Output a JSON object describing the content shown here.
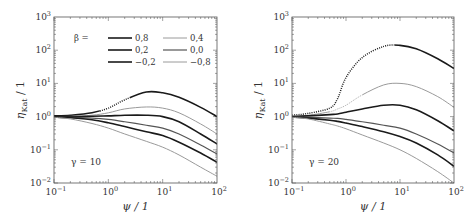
{
  "chart_data": [
    {
      "type": "line",
      "title": "",
      "annotation": "γ = 10",
      "xlabel": "ψ / 1",
      "ylabel": "η_Kat / 1",
      "xscale": "log",
      "yscale": "log",
      "xlim": [
        0.1,
        100
      ],
      "ylim": [
        0.01,
        1000
      ],
      "xticks": [
        "10^-1",
        "10^0",
        "10^1",
        "10^2"
      ],
      "yticks": [
        "10^-2",
        "10^-1",
        "10^0",
        "10^1",
        "10^2",
        "10^3"
      ],
      "grid": false,
      "legend": {
        "title": "β =",
        "position": "upper center"
      },
      "x": [
        0.1,
        0.2,
        0.5,
        1,
        2,
        5,
        10,
        20,
        50,
        100
      ],
      "series": [
        {
          "name": "0,8",
          "values": [
            1.05,
            1.1,
            1.3,
            1.8,
            3.2,
            5.5,
            5.2,
            3.8,
            1.9,
            1.0
          ],
          "style": "dark-thick",
          "dotted_range": [
            0.7,
            2.5
          ]
        },
        {
          "name": "0,4",
          "values": [
            1.0,
            1.02,
            1.1,
            1.3,
            1.7,
            1.95,
            1.8,
            1.3,
            0.6,
            0.3
          ],
          "style": "light-thin"
        },
        {
          "name": "0,2",
          "values": [
            1.0,
            1.0,
            1.02,
            1.05,
            1.1,
            1.1,
            1.0,
            0.7,
            0.3,
            0.15
          ],
          "style": "dark-thick"
        },
        {
          "name": "0,0",
          "values": [
            0.98,
            0.95,
            0.9,
            0.82,
            0.7,
            0.55,
            0.45,
            0.3,
            0.14,
            0.075
          ],
          "style": "medium"
        },
        {
          "name": "-0,2",
          "values": [
            0.97,
            0.92,
            0.8,
            0.65,
            0.5,
            0.35,
            0.27,
            0.17,
            0.08,
            0.042
          ],
          "style": "dark-thick"
        },
        {
          "name": "-0,8",
          "values": [
            0.95,
            0.85,
            0.62,
            0.45,
            0.3,
            0.18,
            0.12,
            0.07,
            0.03,
            0.016
          ],
          "style": "light-thin"
        }
      ]
    },
    {
      "type": "line",
      "title": "",
      "annotation": "γ = 20",
      "xlabel": "ψ / 1",
      "ylabel": "η_Kat / 1",
      "xscale": "log",
      "yscale": "log",
      "xlim": [
        0.1,
        100
      ],
      "ylim": [
        0.01,
        1000
      ],
      "xticks": [
        "10^-1",
        "10^0",
        "10^1",
        "10^2"
      ],
      "yticks": [
        "10^-2",
        "10^-1",
        "10^0",
        "10^1",
        "10^2",
        "10^3"
      ],
      "grid": false,
      "x": [
        0.1,
        0.2,
        0.5,
        0.7,
        1,
        2,
        5,
        10,
        20,
        50,
        100
      ],
      "series": [
        {
          "name": "0,8",
          "values": [
            1.1,
            1.25,
            1.8,
            3.5,
            15,
            60,
            130,
            140,
            110,
            55,
            28
          ],
          "style": "dark-thick",
          "dotted_range": [
            0.1,
            8
          ]
        },
        {
          "name": "0,4",
          "values": [
            1.05,
            1.1,
            1.4,
            1.7,
            2.2,
            4.5,
            9,
            10,
            8,
            4,
            1.9
          ],
          "style": "light-thin",
          "dotted_range": [
            0.5,
            2
          ]
        },
        {
          "name": "0,2",
          "values": [
            1.0,
            1.05,
            1.15,
            1.2,
            1.35,
            1.7,
            2.2,
            2.2,
            1.6,
            0.75,
            0.37
          ],
          "style": "dark-thick"
        },
        {
          "name": "0,0",
          "values": [
            0.98,
            0.95,
            0.9,
            0.88,
            0.82,
            0.7,
            0.55,
            0.45,
            0.3,
            0.15,
            0.08
          ],
          "style": "medium"
        },
        {
          "name": "-0,2",
          "values": [
            0.97,
            0.9,
            0.78,
            0.72,
            0.64,
            0.5,
            0.35,
            0.25,
            0.16,
            0.07,
            0.032
          ],
          "style": "dark-thick"
        },
        {
          "name": "-0,8",
          "values": [
            0.95,
            0.85,
            0.6,
            0.52,
            0.43,
            0.28,
            0.16,
            0.1,
            0.055,
            0.022,
            0.01
          ],
          "style": "light-thin"
        }
      ]
    }
  ],
  "styles": {
    "dark-thick": {
      "color": "#1a1a1a",
      "width": 1.6
    },
    "medium": {
      "color": "#555555",
      "width": 1.2
    },
    "light-thin": {
      "color": "#9a9a9a",
      "width": 1.0
    }
  },
  "legend_title": "β ="
}
